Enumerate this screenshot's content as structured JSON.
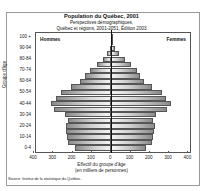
{
  "chart_data": {
    "type": "bar",
    "orientation": "horizontal-pyramid",
    "title": "Population du Québec, 2001",
    "subtitle": [
      "Perspectives démographiques",
      "Québec et régions, 2001-2051, Édition 2003"
    ],
    "xlabel": [
      "Effectif du groupe d'âge",
      "(en milliers de personnes)"
    ],
    "ylabel": "Groupe d'âge",
    "xlim": [
      -400,
      400
    ],
    "x_ticks": [
      "400",
      "300",
      "200",
      "100",
      "0",
      "100",
      "200",
      "300",
      "400"
    ],
    "y_tick_labels": [
      "100 +",
      "90-94",
      "80-84",
      "70-74",
      "60-64",
      "50-54",
      "40-44",
      "30-34",
      "20-24",
      "10-14",
      "0-4"
    ],
    "categories": [
      "0-4",
      "5-9",
      "10-14",
      "15-19",
      "20-24",
      "25-29",
      "30-34",
      "35-39",
      "40-44",
      "45-49",
      "50-54",
      "55-59",
      "60-64",
      "65-69",
      "70-74",
      "75-79",
      "80-84",
      "85-89",
      "90-94",
      "95-99",
      "100+"
    ],
    "series": [
      {
        "name": "Hommes",
        "values": [
          190,
          228,
          232,
          238,
          237,
          225,
          240,
          300,
          318,
          290,
          262,
          212,
          165,
          138,
          110,
          74,
          43,
          20,
          7,
          2,
          0.3
        ]
      },
      {
        "name": "Femmes",
        "values": [
          182,
          218,
          222,
          228,
          232,
          222,
          236,
          296,
          318,
          292,
          266,
          218,
          175,
          155,
          138,
          106,
          76,
          44,
          20,
          6,
          1
        ]
      }
    ],
    "legend": [
      "Hommes",
      "Femmes"
    ],
    "grid": false
  },
  "labels": {
    "title": "Population du Québec, 2001",
    "subtitle1": "Perspectives démographiques,",
    "subtitle2": "Québec et régions, 2001-2051, Édition 2003",
    "men": "Hommes",
    "women": "Femmes",
    "ytitle": "Groupe d'âge",
    "xlab1": "Effectif du groupe d'âge",
    "xlab2": "(en milliers de personnes)",
    "source": "Source: Institut de la statistique du Québec."
  }
}
